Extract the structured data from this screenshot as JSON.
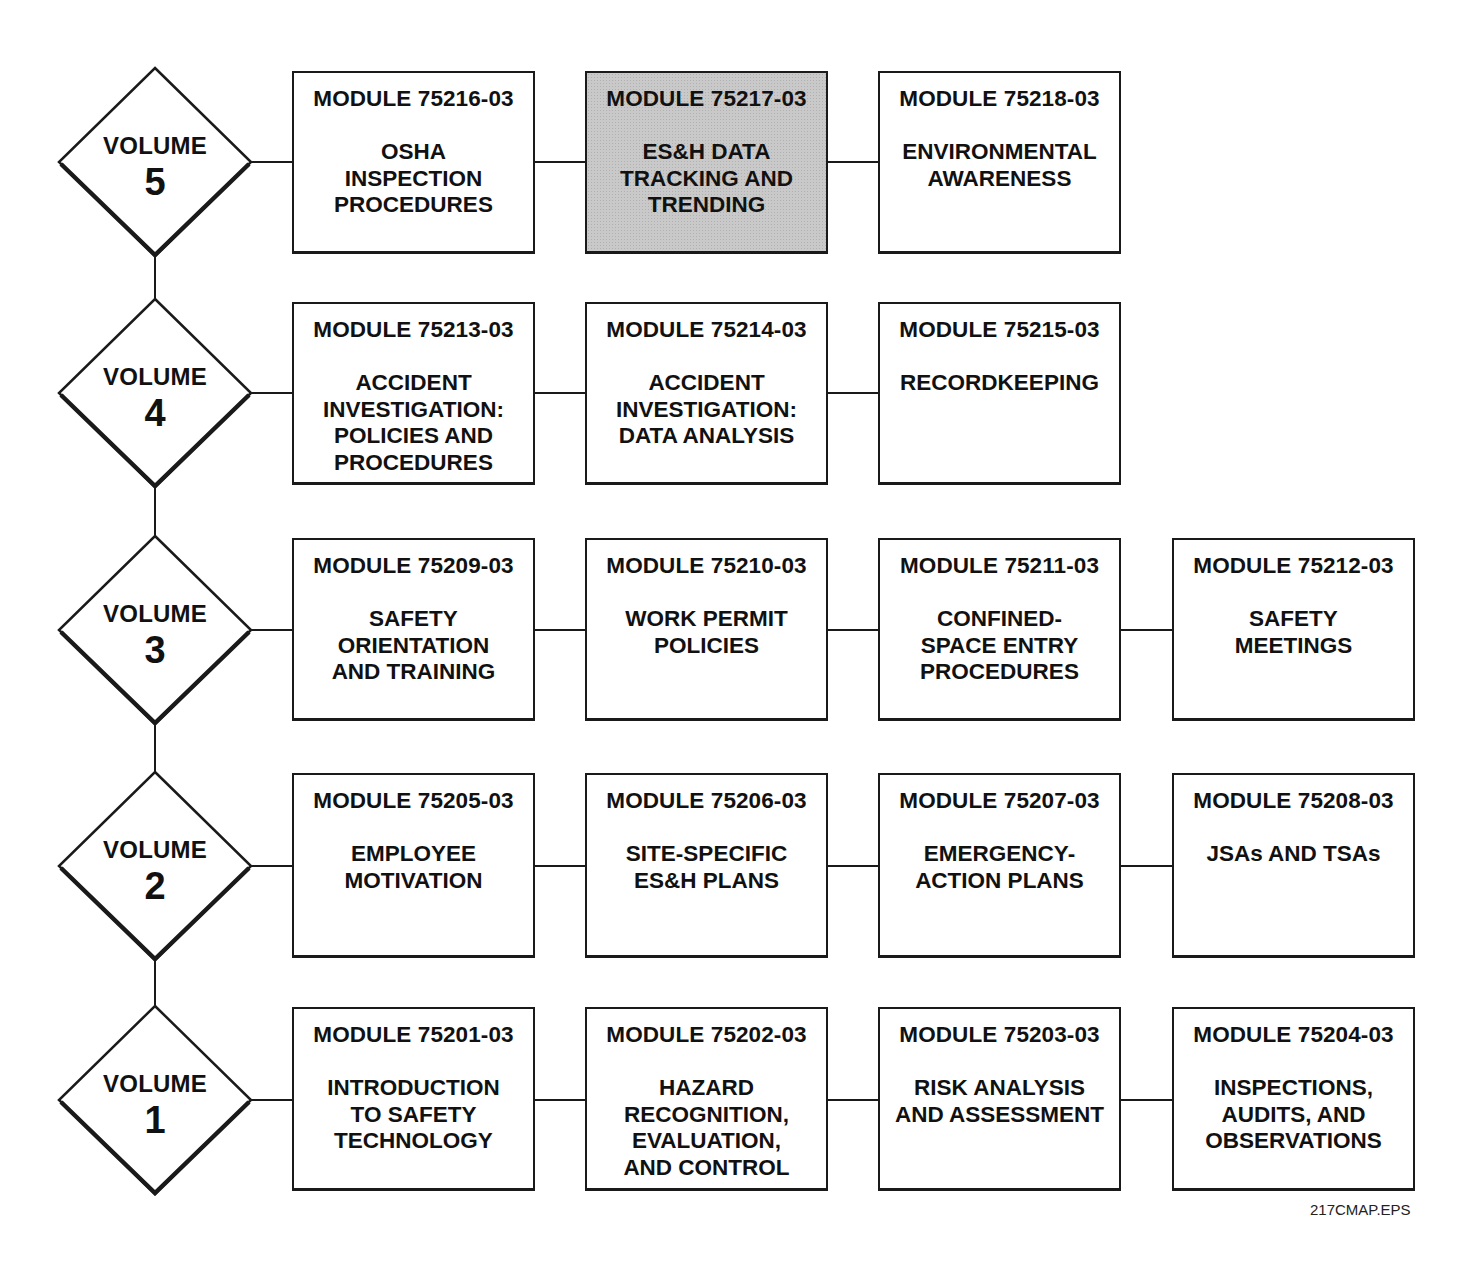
{
  "diagram": {
    "type": "curriculum-map",
    "volumes": [
      {
        "label": "VOLUME",
        "number": "5",
        "cy": 162,
        "box_top": 71,
        "box_height": 183,
        "modules": [
          {
            "id": "MODULE 75216-03",
            "title": "OSHA\nINSPECTION\nPROCEDURES",
            "highlighted": false
          },
          {
            "id": "MODULE 75217-03",
            "title": "ES&H DATA\nTRACKING AND\nTRENDING",
            "highlighted": true
          },
          {
            "id": "MODULE 75218-03",
            "title": "ENVIRONMENTAL\nAWARENESS",
            "highlighted": false
          }
        ]
      },
      {
        "label": "VOLUME",
        "number": "4",
        "cy": 393,
        "box_top": 302,
        "box_height": 183,
        "modules": [
          {
            "id": "MODULE 75213-03",
            "title": "ACCIDENT\nINVESTIGATION:\nPOLICIES AND\nPROCEDURES",
            "highlighted": false
          },
          {
            "id": "MODULE 75214-03",
            "title": "ACCIDENT\nINVESTIGATION:\nDATA ANALYSIS",
            "highlighted": false
          },
          {
            "id": "MODULE 75215-03",
            "title": "RECORDKEEPING",
            "highlighted": false
          }
        ]
      },
      {
        "label": "VOLUME",
        "number": "3",
        "cy": 630,
        "box_top": 538,
        "box_height": 183,
        "modules": [
          {
            "id": "MODULE 75209-03",
            "title": "SAFETY\nORIENTATION\nAND TRAINING",
            "highlighted": false
          },
          {
            "id": "MODULE 75210-03",
            "title": "WORK PERMIT\nPOLICIES",
            "highlighted": false
          },
          {
            "id": "MODULE 75211-03",
            "title": "CONFINED-\nSPACE ENTRY\nPROCEDURES",
            "highlighted": false
          },
          {
            "id": "MODULE 75212-03",
            "title": "SAFETY\nMEETINGS",
            "highlighted": false
          }
        ]
      },
      {
        "label": "VOLUME",
        "number": "2",
        "cy": 866,
        "box_top": 773,
        "box_height": 185,
        "modules": [
          {
            "id": "MODULE 75205-03",
            "title": "EMPLOYEE\nMOTIVATION",
            "highlighted": false
          },
          {
            "id": "MODULE 75206-03",
            "title": "SITE-SPECIFIC\nES&H PLANS",
            "highlighted": false
          },
          {
            "id": "MODULE 75207-03",
            "title": "EMERGENCY-\nACTION PLANS",
            "highlighted": false
          },
          {
            "id": "MODULE 75208-03",
            "title": "JSAs AND TSAs",
            "highlighted": false
          }
        ]
      },
      {
        "label": "VOLUME",
        "number": "1",
        "cy": 1100,
        "box_top": 1007,
        "box_height": 184,
        "modules": [
          {
            "id": "MODULE 75201-03",
            "title": "INTRODUCTION\nTO SAFETY\nTECHNOLOGY",
            "highlighted": false
          },
          {
            "id": "MODULE 75202-03",
            "title": "HAZARD\nRECOGNITION,\nEVALUATION,\nAND CONTROL",
            "highlighted": false
          },
          {
            "id": "MODULE 75203-03",
            "title": "RISK ANALYSIS\nAND ASSESSMENT",
            "highlighted": false
          },
          {
            "id": "MODULE 75204-03",
            "title": "INSPECTIONS,\nAUDITS, AND\nOBSERVATIONS",
            "highlighted": false
          }
        ]
      }
    ],
    "file_label": "217CMAP.EPS",
    "colors": {
      "line": "#1a1a1a",
      "highlight_fill": "#c9c9c9",
      "background": "#ffffff"
    }
  }
}
